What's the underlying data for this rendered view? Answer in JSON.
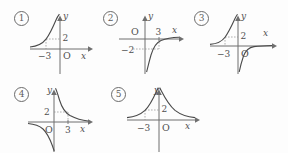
{
  "page": {
    "background": "#fdfdfd",
    "ink": "#4f4f4f",
    "axis_color": "#6f6f6f",
    "curve_color": "#4a4a4a",
    "dash_color": "#8e8e8e"
  },
  "figures": [
    {
      "id": "fig-1",
      "marker": "①",
      "marker_digit": "1",
      "axis_x_label": "x",
      "axis_y_label": "y",
      "origin_label": "O",
      "x_tick_label": "−3",
      "y_tick_label": "2",
      "x_tick_value": -3,
      "y_tick_value": 2,
      "branches": [
        "quadrant-II-rising"
      ],
      "shape": "single branch in the second quadrant, rising steeply toward the y-axis and flattening toward the negative x-axis"
    },
    {
      "id": "fig-2",
      "marker": "②",
      "marker_digit": "2",
      "axis_x_label": "x",
      "axis_y_label": "y",
      "origin_label": "O",
      "x_tick_label": "3",
      "y_tick_label": "−2",
      "x_tick_value": 3,
      "y_tick_value": -2,
      "branches": [
        "quadrant-IV-rising"
      ],
      "shape": "single branch in the fourth quadrant, descending steeply beside the y-axis and flattening toward the positive x-axis"
    },
    {
      "id": "fig-3",
      "marker": "③",
      "marker_digit": "3",
      "axis_x_label": "x",
      "axis_y_label": "y",
      "origin_label": "O",
      "x_tick_label": "−3",
      "y_tick_label": "2",
      "x_tick_value": -3,
      "y_tick_value": 2,
      "branches": [
        "quadrant-II-rising",
        "quadrant-IV-falling"
      ],
      "shape": "two branches: one in the second quadrant and one in the fourth quadrant"
    },
    {
      "id": "fig-4",
      "marker": "④",
      "marker_digit": "4",
      "axis_x_label": "x",
      "axis_y_label": "y",
      "origin_label": "O",
      "x_tick_label": "3",
      "y_tick_label": "2",
      "x_tick_value": 3,
      "y_tick_value": 2,
      "branches": [
        "quadrant-I-falling",
        "quadrant-III-falling"
      ],
      "shape": "two branches: one in the first quadrant and one in the third quadrant"
    },
    {
      "id": "fig-5",
      "marker": "⑤",
      "marker_digit": "5",
      "axis_x_label": "x",
      "axis_y_label": "y",
      "origin_label": "O",
      "x_tick_label": "−3",
      "y_tick_label": "2",
      "x_tick_value": -3,
      "y_tick_value": 2,
      "branches": [
        "quadrant-II-rising",
        "quadrant-I-rising"
      ],
      "shape": "two branches both above the x-axis, symmetric about the y-axis, rising toward the y-axis"
    }
  ]
}
